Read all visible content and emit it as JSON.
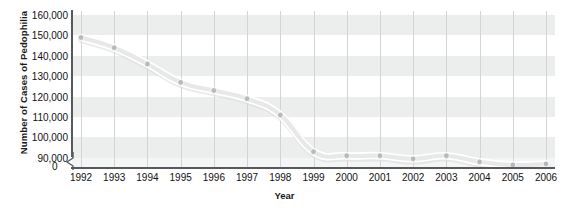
{
  "chart_data": {
    "type": "line",
    "title": "",
    "xlabel": "Year",
    "ylabel": "Number of Cases of Pedophilia",
    "x": [
      1992,
      1993,
      1994,
      1995,
      1996,
      1997,
      1998,
      1999,
      2000,
      2001,
      2002,
      2003,
      2004,
      2005,
      2006
    ],
    "categories": [
      "1992",
      "1993",
      "1994",
      "1995",
      "1996",
      "1997",
      "1998",
      "1999",
      "2000",
      "2001",
      "2002",
      "2003",
      "2004",
      "2005",
      "2006"
    ],
    "values": [
      149000,
      144000,
      136000,
      127000,
      123000,
      119000,
      111000,
      93000,
      91000,
      91000,
      89500,
      91000,
      88000,
      86500,
      87000
    ],
    "series": [
      {
        "name": "Number of Cases of Pedophilia",
        "values": [
          149000,
          144000,
          136000,
          127000,
          123000,
          119000,
          111000,
          93000,
          91000,
          91000,
          89500,
          91000,
          88000,
          86500,
          87000
        ]
      }
    ],
    "ylim": [
      85000,
      162000
    ],
    "yticks": [
      90000,
      100000,
      110000,
      120000,
      130000,
      140000,
      150000,
      160000
    ],
    "ytick_labels": [
      "90,000",
      "100,000",
      "110,000",
      "120,000",
      "130,000",
      "140,000",
      "150,000",
      "160,000"
    ],
    "y_axis_break_label": "0",
    "y_axis_has_break": true,
    "grid": "horizontal-bands-and-vertical-lines",
    "legend": "none",
    "line_color": "#e8e8e8",
    "line_outline_color": "#ffffff",
    "marker_color": "#b7babc",
    "band_color": "#eceded",
    "gridline_color": "#d2d4d6",
    "axis_color": "#58595b"
  },
  "axes": {
    "y_title": "Number of Cases of Pedophilia",
    "x_title": "Year",
    "zero_label": "0"
  }
}
